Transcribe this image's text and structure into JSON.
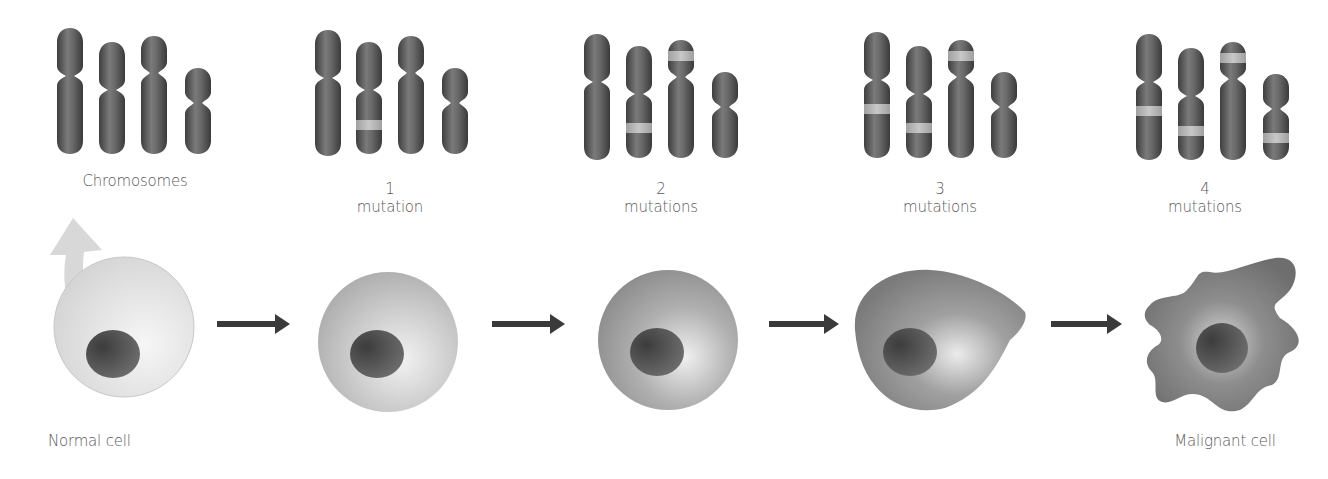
{
  "figure": {
    "title_fragment_visible": "",
    "stages": [
      {
        "id": "stage-0",
        "chromosome_label_line1": "Chromosomes",
        "chromosome_label_line2": "",
        "cell_label": "Normal cell",
        "mutation_count": 0,
        "cell_shape": "round",
        "cell_tone": "light"
      },
      {
        "id": "stage-1",
        "chromosome_label_line1": "1",
        "chromosome_label_line2": "mutation",
        "cell_label": "",
        "mutation_count": 1,
        "cell_shape": "round",
        "cell_tone": "light-medium"
      },
      {
        "id": "stage-2",
        "chromosome_label_line1": "2",
        "chromosome_label_line2": "mutations",
        "cell_label": "",
        "mutation_count": 2,
        "cell_shape": "round",
        "cell_tone": "medium"
      },
      {
        "id": "stage-3",
        "chromosome_label_line1": "3",
        "chromosome_label_line2": "mutations",
        "cell_label": "",
        "mutation_count": 3,
        "cell_shape": "teardrop",
        "cell_tone": "medium-dark"
      },
      {
        "id": "stage-4",
        "chromosome_label_line1": "4",
        "chromosome_label_line2": "mutations",
        "cell_label": "Malignant cell",
        "mutation_count": 4,
        "cell_shape": "irregular",
        "cell_tone": "dark"
      }
    ],
    "arrows_between_cells": 4,
    "icons": {
      "progression_arrow": "right-arrow-icon",
      "zoom_arrow": "curved-up-arrow-icon"
    },
    "colors": {
      "chromosome": "#4f4f4f",
      "chromosome_highlight": "#8a8a8a",
      "mutation_band": "#b5b5b5",
      "arrow": "#3a3a3a",
      "nucleus": "#555555",
      "label_text": "#5a5a5a",
      "zoom_arrow": "#d2d2d2"
    }
  }
}
